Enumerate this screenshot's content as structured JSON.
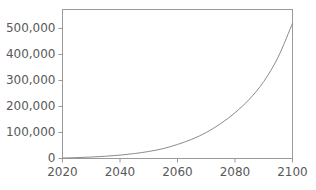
{
  "chart_data": {
    "type": "line",
    "title": "",
    "subtitle": "",
    "xlabel": "",
    "ylabel": "",
    "xlim": [
      2020,
      2100
    ],
    "ylim": [
      0,
      573000
    ],
    "grid": false,
    "legend": null,
    "x_ticks": [
      2020,
      2040,
      2060,
      2080,
      2100
    ],
    "x_tick_labels": [
      "2020",
      "2040",
      "2060",
      "2080",
      "2100"
    ],
    "y_ticks": [
      0,
      100000,
      200000,
      300000,
      400000,
      500000
    ],
    "y_tick_labels": [
      "0",
      "100,000",
      "200,000",
      "300,000",
      "400,000",
      "500,000"
    ],
    "series": [
      {
        "name": "",
        "color": "#8c8c8c",
        "x": [
          2020,
          2025,
          2030,
          2035,
          2040,
          2045,
          2050,
          2055,
          2060,
          2065,
          2070,
          2075,
          2080,
          2085,
          2090,
          2095,
          2100
        ],
        "values": [
          2000,
          3400,
          5600,
          8700,
          13000,
          19000,
          27000,
          38000,
          54000,
          74000,
          100000,
          134000,
          176000,
          228000,
          296000,
          390000,
          520000
        ]
      }
    ]
  },
  "axes": {
    "frame_color": "#9a9a9a",
    "tick_color": "#9a9a9a",
    "label_color": "#595959",
    "background": "#ffffff"
  }
}
